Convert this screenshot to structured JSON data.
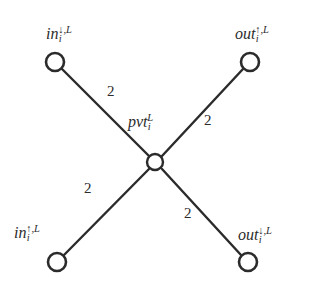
{
  "figure": {
    "background_color": "#ffffff",
    "stroke_color": "#2b2b2b",
    "width": 317,
    "height": 287
  },
  "nodes": [
    {
      "id": "in-down",
      "base": "in",
      "subscript": "i",
      "superscript_arrow": "↓",
      "superscript_sep": ",",
      "superscript_layer": "L",
      "x": 55,
      "y": 62,
      "r": 9
    },
    {
      "id": "out-up",
      "base": "out",
      "subscript": "i",
      "superscript_arrow": "↑",
      "superscript_sep": ",",
      "superscript_layer": "L",
      "x": 250,
      "y": 62,
      "r": 9
    },
    {
      "id": "pvt",
      "base": "pvt",
      "subscript": "i",
      "superscript_arrow": "",
      "superscript_sep": "",
      "superscript_layer": "L",
      "x": 155,
      "y": 162,
      "r": 8
    },
    {
      "id": "in-up",
      "base": "in",
      "subscript": "i",
      "superscript_arrow": "↑",
      "superscript_sep": ",",
      "superscript_layer": "L",
      "x": 57,
      "y": 262,
      "r": 9
    },
    {
      "id": "out-down",
      "base": "out",
      "subscript": "i",
      "superscript_arrow": "↓",
      "superscript_sep": ",",
      "superscript_layer": "L",
      "x": 248,
      "y": 262,
      "r": 9
    }
  ],
  "edges": [
    {
      "id": "edge-upper-left",
      "from": "in-down",
      "to": "pvt",
      "weight": "2"
    },
    {
      "id": "edge-upper-right",
      "from": "out-up",
      "to": "pvt",
      "weight": "2"
    },
    {
      "id": "edge-lower-left",
      "from": "in-up",
      "to": "pvt",
      "weight": "2"
    },
    {
      "id": "edge-lower-right",
      "from": "out-down",
      "to": "pvt",
      "weight": "2"
    }
  ]
}
